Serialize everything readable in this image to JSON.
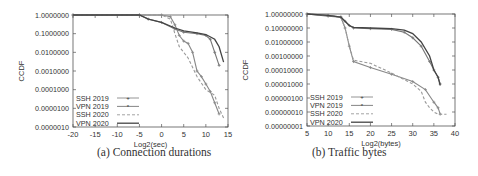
{
  "chart_data": [
    {
      "type": "line",
      "title": "",
      "caption": "(a) Connection durations",
      "xlabel": "Log2(sec)",
      "ylabel": "CCDF",
      "xlim": [
        -20,
        15
      ],
      "ylim": [
        1e-06,
        1
      ],
      "yscale": "log",
      "x_ticks": [
        -20,
        -15,
        -10,
        -5,
        0,
        5,
        10,
        15
      ],
      "y_tick_labels": [
        "1.0000000",
        "0.1000000",
        "0.0100000",
        "0.0010000",
        "0.0001000",
        "0.0000100",
        "0.0000010"
      ],
      "legend_position": "lower left",
      "grid": false,
      "series": [
        {
          "name": "SSH 2019",
          "style": "solid-plus",
          "color": "#888888",
          "x": [
            -20,
            -5,
            0,
            2,
            3,
            4,
            5,
            6,
            7,
            8,
            9,
            10,
            11,
            12,
            13
          ],
          "y": [
            1,
            1,
            1,
            0.8,
            0.3,
            0.08,
            0.04,
            0.03,
            0.01,
            0.001,
            0.0005,
            0.0002,
            8e-05,
            2e-05,
            5e-06
          ]
        },
        {
          "name": "VPN 2019",
          "style": "solid-star",
          "color": "#777777",
          "x": [
            -20,
            -5,
            -3,
            0,
            3,
            5,
            8,
            10,
            11,
            12,
            13
          ],
          "y": [
            1,
            1,
            0.6,
            0.4,
            0.18,
            0.12,
            0.1,
            0.08,
            0.05,
            0.01,
            0.002
          ]
        },
        {
          "name": "SSH 2020",
          "style": "dashed",
          "color": "#999999",
          "x": [
            -20,
            -5,
            0,
            2,
            3,
            4,
            6,
            8,
            10,
            12,
            13,
            14
          ],
          "y": [
            1,
            1,
            1,
            0.6,
            0.1,
            0.02,
            0.005,
            0.0005,
            0.0001,
            5e-05,
            1e-05,
            3e-06
          ]
        },
        {
          "name": "VPN 2020",
          "style": "solid",
          "color": "#444444",
          "x": [
            -20,
            -5,
            -3,
            0,
            3,
            5,
            8,
            10,
            12,
            13,
            14
          ],
          "y": [
            1,
            1,
            0.6,
            0.4,
            0.2,
            0.14,
            0.11,
            0.09,
            0.05,
            0.02,
            0.003
          ]
        }
      ]
    },
    {
      "type": "line",
      "title": "",
      "caption": "(b) Traffic bytes",
      "xlabel": "Log2(bytes)",
      "ylabel": "CCDF",
      "xlim": [
        5,
        40
      ],
      "ylim": [
        1e-08,
        1
      ],
      "yscale": "log",
      "x_ticks": [
        5,
        10,
        15,
        20,
        25,
        30,
        35,
        40
      ],
      "y_tick_labels": [
        "1.00000000",
        "0.10000000",
        "0.01000000",
        "0.00100000",
        "0.00010000",
        "0.00001000",
        "0.00000100",
        "0.00000010",
        "0.00000001"
      ],
      "legend_position": "lower left",
      "grid": false,
      "series": [
        {
          "name": "SSH 2019",
          "style": "solid-plus",
          "color": "#888888",
          "x": [
            5,
            10,
            13,
            14,
            15,
            16,
            20,
            25,
            30,
            33,
            35,
            36,
            36.5
          ],
          "y": [
            1,
            0.8,
            0.6,
            0.1,
            0.005,
            0.0004,
            0.00015,
            5e-05,
            1.5e-05,
            4e-06,
            5e-07,
            2e-07,
            7e-08
          ]
        },
        {
          "name": "VPN 2019",
          "style": "solid-star",
          "color": "#777777",
          "x": [
            5,
            10,
            13,
            14,
            15,
            16,
            20,
            25,
            28,
            30,
            32,
            34,
            35,
            36,
            36.5
          ],
          "y": [
            1,
            0.7,
            0.6,
            0.3,
            0.15,
            0.1,
            0.09,
            0.08,
            0.05,
            0.02,
            0.005,
            0.0004,
            0.0001,
            3e-05,
            1e-05
          ]
        },
        {
          "name": "SSH 2020",
          "style": "dashed",
          "color": "#999999",
          "x": [
            5,
            10,
            13,
            14,
            15,
            16,
            20,
            25,
            30,
            32,
            33,
            34,
            35,
            36,
            37,
            38
          ],
          "y": [
            1,
            0.8,
            0.6,
            0.1,
            0.005,
            0.0005,
            0.0003,
            6e-05,
            1e-05,
            3e-06,
            5e-07,
            2e-07,
            1e-07,
            7e-08,
            7e-08,
            7e-08
          ]
        },
        {
          "name": "VPN 2020",
          "style": "solid",
          "color": "#444444",
          "x": [
            5,
            10,
            13,
            14,
            15,
            16,
            20,
            25,
            28,
            30,
            32,
            34,
            35,
            36,
            36.5
          ],
          "y": [
            1,
            0.8,
            0.6,
            0.3,
            0.15,
            0.11,
            0.1,
            0.09,
            0.07,
            0.04,
            0.01,
            0.001,
            0.0001,
            3e-05,
            8e-06
          ]
        }
      ]
    }
  ]
}
